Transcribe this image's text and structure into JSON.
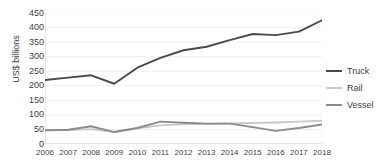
{
  "chart_data": {
    "type": "line",
    "title": "",
    "xlabel": "",
    "ylabel": "US$ billions",
    "categories": [
      "2006",
      "2007",
      "2008",
      "2009",
      "2010",
      "2011",
      "2012",
      "2013",
      "2014",
      "2015",
      "2016",
      "2017",
      "2018"
    ],
    "ylim": [
      0,
      450
    ],
    "ytick_values": [
      0,
      50,
      100,
      150,
      200,
      250,
      300,
      350,
      400,
      450
    ],
    "ytick_labels": [
      "0",
      "50",
      "100",
      "150",
      "200",
      "250",
      "300",
      "350",
      "400",
      "450"
    ],
    "grid": true,
    "legend_position": "right",
    "series": [
      {
        "name": "Truck",
        "color": "#4a4a4a",
        "values": [
          220,
          228,
          236,
          207,
          262,
          296,
          322,
          334,
          357,
          378,
          374,
          386,
          425
        ]
      },
      {
        "name": "Rail",
        "color": "#c9c9c9",
        "values": [
          47,
          48,
          51,
          41,
          54,
          64,
          68,
          69,
          71,
          72,
          74,
          77,
          80
        ]
      },
      {
        "name": "Vessel",
        "color": "#8c8c8c",
        "values": [
          47,
          49,
          61,
          41,
          55,
          77,
          73,
          70,
          70,
          58,
          45,
          55,
          67
        ]
      }
    ]
  },
  "axis": {
    "y_title": "US$ billions"
  },
  "legend": {
    "items": [
      {
        "label": "Truck",
        "icon": "line-swatch-truck"
      },
      {
        "label": "Rail",
        "icon": "line-swatch-rail"
      },
      {
        "label": "Vessel",
        "icon": "line-swatch-vessel"
      }
    ]
  }
}
